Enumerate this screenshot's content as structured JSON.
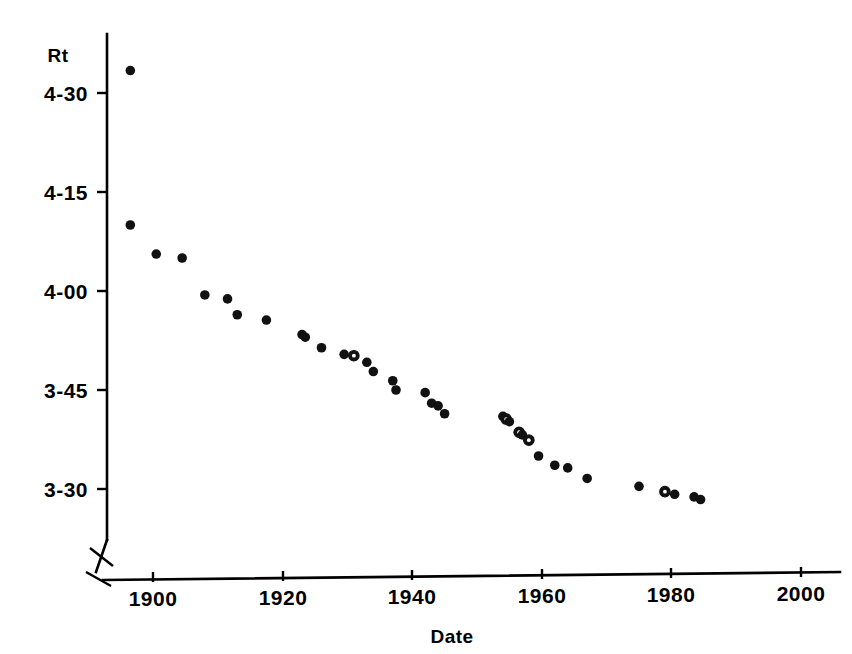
{
  "chart_data": {
    "type": "scatter",
    "title": "",
    "subtitle": "",
    "xlabel": "Date",
    "ylabel": "Rt",
    "xlim": [
      1890,
      2003
    ],
    "ylim": [
      205,
      280
    ],
    "x_ticks": [
      1900,
      1920,
      1940,
      1960,
      1980,
      2000
    ],
    "x_tick_labels": [
      "1900",
      "1920",
      "1940",
      "1960",
      "1980",
      "2000"
    ],
    "y_ticks": [
      270,
      255,
      240,
      225,
      210
    ],
    "y_tick_labels": [
      "4-30",
      "4-15",
      "4-00",
      "3-45",
      "3-30"
    ],
    "y_units": "minutes-seconds",
    "grid": false,
    "legend": null,
    "axis_break": "x-axis break between origin and 1900",
    "series": [
      {
        "name": "World record mile time",
        "marker": "filled-circle",
        "points": [
          {
            "x": 1896.5,
            "y": 273.4,
            "label": "4-33.4",
            "marker": "filled"
          },
          {
            "x": 1896.5,
            "y": 250.0,
            "label": "4-10.0",
            "marker": "filled"
          },
          {
            "x": 1900.5,
            "y": 245.6,
            "label": "4-05.6",
            "marker": "filled"
          },
          {
            "x": 1904.5,
            "y": 245.0,
            "label": "4-05.0",
            "marker": "filled"
          },
          {
            "x": 1908.0,
            "y": 239.4,
            "label": "4-00.4",
            "marker": "filled"
          },
          {
            "x": 1911.5,
            "y": 238.8,
            "label": "3-59.8",
            "marker": "filled"
          },
          {
            "x": 1913.0,
            "y": 236.4,
            "label": "3-56.4",
            "marker": "filled"
          },
          {
            "x": 1917.5,
            "y": 235.6,
            "label": "3-55.6",
            "marker": "filled"
          },
          {
            "x": 1923.0,
            "y": 233.4,
            "label": "3-53.4",
            "marker": "filled"
          },
          {
            "x": 1923.5,
            "y": 233.0,
            "label": "3-53.0",
            "marker": "filled"
          },
          {
            "x": 1926.0,
            "y": 231.4,
            "label": "3-51.4",
            "marker": "filled"
          },
          {
            "x": 1929.5,
            "y": 230.4,
            "label": "3-50.4",
            "marker": "filled"
          },
          {
            "x": 1931.0,
            "y": 230.2,
            "label": "3-50.2",
            "marker": "open"
          },
          {
            "x": 1933.0,
            "y": 229.2,
            "label": "3-49.2",
            "marker": "filled"
          },
          {
            "x": 1934.0,
            "y": 227.8,
            "label": "3-47.8",
            "marker": "filled"
          },
          {
            "x": 1937.0,
            "y": 226.4,
            "label": "3-46.4",
            "marker": "filled"
          },
          {
            "x": 1937.5,
            "y": 225.0,
            "label": "3-45.0",
            "marker": "filled"
          },
          {
            "x": 1942.0,
            "y": 224.6,
            "label": "3-44.6",
            "marker": "filled"
          },
          {
            "x": 1943.0,
            "y": 223.0,
            "label": "3-43.0",
            "marker": "filled"
          },
          {
            "x": 1944.0,
            "y": 222.6,
            "label": "3-42.6",
            "marker": "filled"
          },
          {
            "x": 1945.0,
            "y": 221.4,
            "label": "3-41.4",
            "marker": "filled"
          },
          {
            "x": 1954.0,
            "y": 221.0,
            "label": "3-41.0",
            "marker": "filled"
          },
          {
            "x": 1954.5,
            "y": 220.6,
            "label": "3-40.6",
            "marker": "open"
          },
          {
            "x": 1955.0,
            "y": 220.2,
            "label": "3-40.2",
            "marker": "filled"
          },
          {
            "x": 1956.5,
            "y": 218.6,
            "label": "3-38.6",
            "marker": "open"
          },
          {
            "x": 1957.0,
            "y": 218.2,
            "label": "3-38.2",
            "marker": "filled"
          },
          {
            "x": 1958.0,
            "y": 217.4,
            "label": "3-37.4",
            "marker": "open"
          },
          {
            "x": 1959.5,
            "y": 215.0,
            "label": "3-35.0",
            "marker": "filled"
          },
          {
            "x": 1962.0,
            "y": 213.6,
            "label": "3-33.6",
            "marker": "filled"
          },
          {
            "x": 1964.0,
            "y": 213.2,
            "label": "3-33.2",
            "marker": "filled"
          },
          {
            "x": 1967.0,
            "y": 211.6,
            "label": "3-31.6",
            "marker": "filled"
          },
          {
            "x": 1975.0,
            "y": 210.4,
            "label": "3-30.4",
            "marker": "filled"
          },
          {
            "x": 1979.0,
            "y": 209.6,
            "label": "3-29.6",
            "marker": "open"
          },
          {
            "x": 1980.5,
            "y": 209.2,
            "label": "3-29.2",
            "marker": "filled"
          },
          {
            "x": 1983.5,
            "y": 208.8,
            "label": "3-28.8",
            "marker": "filled"
          },
          {
            "x": 1984.5,
            "y": 208.4,
            "label": "3-28.4",
            "marker": "filled"
          }
        ]
      }
    ]
  },
  "figure": {
    "background_color": "#ffffff",
    "ink_color": "#000000"
  }
}
